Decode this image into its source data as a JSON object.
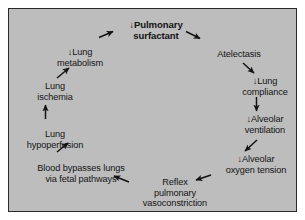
{
  "diagram": {
    "background_color": "#bdbdbd",
    "border_color": "#2a2a2a",
    "page_background": "#ffffff",
    "text_color": "#141414",
    "arrow_color": "#141414",
    "type": "cycle-flow-diagram",
    "nodes": [
      {
        "id": "pulmonary-surfactant",
        "line1": "↓Pulmonary",
        "line2": "surfactant",
        "bold": true
      },
      {
        "id": "atelectasis",
        "line1": "Atelectasis",
        "line2": "",
        "bold": false
      },
      {
        "id": "lung-compliance",
        "line1": "↓Lung",
        "line2": "compliance",
        "bold": false
      },
      {
        "id": "alveolar-ventilation",
        "line1": "↓Alveolar",
        "line2": "ventilation",
        "bold": false
      },
      {
        "id": "alveolar-oxygen-tension",
        "line1": "↓Alveolar",
        "line2": "oxygen tension",
        "bold": false
      },
      {
        "id": "reflex-pulmonary-vasoconstriction",
        "line1": "Reflex",
        "line2": "pulmonary",
        "line3": "vasoconstriction",
        "bold": false
      },
      {
        "id": "blood-bypasses-lungs",
        "line1": "Blood bypasses lungs",
        "line2": "via fetal pathways",
        "bold": false
      },
      {
        "id": "lung-hypoperfusion",
        "line1": "Lung",
        "line2": "hypoperfusion",
        "bold": false
      },
      {
        "id": "lung-ischemia",
        "line1": "Lung",
        "line2": "ischemia",
        "bold": false
      },
      {
        "id": "lung-metabolism",
        "line1": "↓Lung",
        "line2": "metabolism",
        "bold": false
      }
    ],
    "arrows": [
      {
        "id": "surfactant-to-atelectasis",
        "direction": "down-right"
      },
      {
        "id": "atelectasis-to-compliance",
        "direction": "down-right"
      },
      {
        "id": "compliance-to-ventilation",
        "direction": "down"
      },
      {
        "id": "ventilation-to-oxygen-tension",
        "direction": "down-left"
      },
      {
        "id": "oxygen-tension-to-vasoconstriction",
        "direction": "left"
      },
      {
        "id": "vasoconstriction-to-blood-bypasses",
        "direction": "up-left"
      },
      {
        "id": "blood-bypasses-to-hypoperfusion",
        "direction": "up-right"
      },
      {
        "id": "hypoperfusion-to-ischemia",
        "direction": "up"
      },
      {
        "id": "ischemia-to-metabolism",
        "direction": "up-right"
      },
      {
        "id": "metabolism-to-surfactant",
        "direction": "up-right"
      }
    ]
  }
}
